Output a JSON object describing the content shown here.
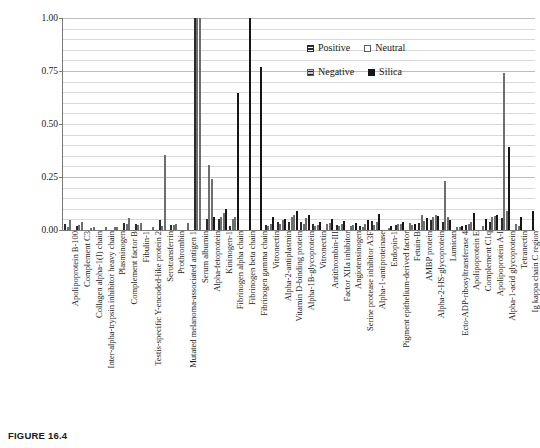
{
  "figure": {
    "caption": "FIGURE 16.4"
  },
  "legend": {
    "position": "inside-top-right",
    "rows": [
      [
        {
          "label": "Positive",
          "key": "positive",
          "swatch": "positive-swatch-icon"
        },
        {
          "label": "Neutral",
          "key": "neutral",
          "swatch": "neutral-swatch-icon"
        }
      ],
      [
        {
          "label": "Negative",
          "key": "negative",
          "swatch": "negative-swatch-icon"
        },
        {
          "label": "Silica",
          "key": "silica",
          "swatch": "silica-swatch-icon"
        }
      ]
    ]
  },
  "colors": {
    "positive": "#2b2b2b",
    "neutral": "#ffffff",
    "negative": "#d2d2d2",
    "silica": "#161616",
    "gridline": "#d9d9d9",
    "axis": "#7a7a7a"
  },
  "chart_data": {
    "type": "bar",
    "title": "",
    "xlabel": "",
    "ylabel": "Relative amount",
    "ylim": [
      0,
      1.0
    ],
    "yticks": [
      "0.00",
      "0.25",
      "0.50",
      "0.75",
      "1.00"
    ],
    "ytick_values": [
      0,
      0.25,
      0.5,
      0.75,
      1.0
    ],
    "grid": true,
    "minor_grid": true,
    "legend_position": "inside-top-right",
    "categories": [
      "Apolipoprotein B-100",
      "Complement C3",
      "Collagen alpha-1(I) chain",
      "Inter-alpha-trypsin inhibitor heavy chain",
      "Plasminogen",
      "Complement factor B",
      "Fibulin-1",
      "Testis-specific Y-encoded-like protein 2",
      "Serotransferrin",
      "Prothrombin",
      "Mutated melanoma-associated antigen 1",
      "Serum albumin",
      "Alpha-fetoprotein",
      "Kininogen-1",
      "Fibrinogen alpha chain",
      "Fibrinogen beta chain",
      "Fibrinogen gamma chain",
      "Vitronectin",
      "Alpha-2-antiplasmin",
      "Vitamin D-binding protein",
      "Alpha-1B-glycoprotein",
      "Vitronectin",
      "Antithrombin-III",
      "Factor XIIa inhibitor",
      "Angiotensinogen",
      "Serine protease inhibitor A3F",
      "Alpha-1-antiproteinase",
      "Endopin-1",
      "Pigment epithelium-derived factor",
      "Fetuin-B",
      "AMBP protein",
      "Alpha-2-HS-glycoprotein",
      "Lumican",
      "Ecto-ADP-ribosyltransferase 4",
      "Apolipoprotein E",
      "Complement C1q",
      "Apolipoprotein A-I",
      "Alpha-1-acid glycoprotein",
      "Tetranectin",
      "Ig kappa chain C region"
    ],
    "series": [
      {
        "name": "Positive",
        "key": "positive",
        "values": [
          0.03,
          0.018,
          0.0,
          0.0,
          0.0,
          0.033,
          0.028,
          0.0,
          0.045,
          0.026,
          0.0,
          1.0,
          0.05,
          0.052,
          0.02,
          0.0,
          0.0,
          0.025,
          0.038,
          0.04,
          0.036,
          0.03,
          0.0,
          0.026,
          0.0,
          0.02,
          0.042,
          0.0,
          0.024,
          0.0,
          0.034,
          0.045,
          0.038,
          0.0,
          0.022,
          0.0,
          0.04,
          0.055,
          0.0,
          0.0
        ]
      },
      {
        "name": "Neutral",
        "key": "neutral",
        "values": [
          0.012,
          0.026,
          0.01,
          0.0,
          0.015,
          0.03,
          0.024,
          0.0,
          0.02,
          0.022,
          0.0,
          1.0,
          0.305,
          0.06,
          0.05,
          0.0,
          0.0,
          0.02,
          0.03,
          0.062,
          0.03,
          0.018,
          0.028,
          0.02,
          0.02,
          0.015,
          0.022,
          0.0,
          0.03,
          0.035,
          0.07,
          0.06,
          0.232,
          0.012,
          0.03,
          0.0,
          0.06,
          0.74,
          0.03,
          0.0
        ]
      },
      {
        "name": "Negative",
        "key": "negative",
        "values": [
          0.048,
          0.036,
          0.016,
          0.012,
          0.014,
          0.055,
          0.032,
          0.012,
          0.352,
          0.03,
          0.032,
          1.0,
          0.24,
          0.078,
          0.062,
          0.0,
          0.0,
          0.03,
          0.048,
          0.07,
          0.055,
          0.026,
          0.032,
          0.03,
          0.024,
          0.028,
          0.036,
          0.01,
          0.028,
          0.022,
          0.042,
          0.072,
          0.06,
          0.014,
          0.04,
          0.018,
          0.065,
          0.088,
          0.018,
          0.0
        ]
      },
      {
        "name": "Silica",
        "key": "silica",
        "values": [
          0.0,
          0.0,
          0.0,
          0.0,
          0.0,
          0.0,
          0.0,
          0.0,
          0.0,
          0.0,
          0.0,
          0.0,
          0.06,
          0.1,
          0.645,
          1.0,
          0.77,
          0.062,
          0.05,
          0.09,
          0.07,
          0.04,
          0.05,
          0.042,
          0.035,
          0.048,
          0.075,
          0.02,
          0.04,
          0.03,
          0.055,
          0.068,
          0.045,
          0.02,
          0.082,
          0.05,
          0.072,
          0.39,
          0.06,
          0.088
        ]
      }
    ]
  }
}
